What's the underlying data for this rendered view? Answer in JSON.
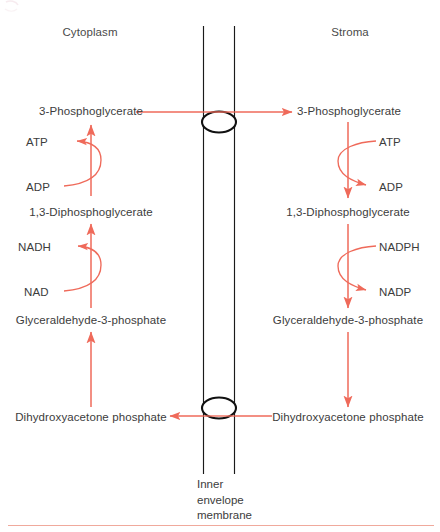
{
  "figure": {
    "accent_color": "#ef6a5a",
    "text_color": "#3c3c3c",
    "membrane_color": "#1a1a1a",
    "background_color": "#ffffff"
  },
  "regions": {
    "left": "Cytoplasm",
    "right": "Stroma"
  },
  "membrane": {
    "caption_line1": "Inner",
    "caption_line2": "envelope",
    "caption_line3": "membrane",
    "translocator_upper": "translocator-pore-upper",
    "translocator_lower": "translocator-pore-lower"
  },
  "cytoplasm": {
    "metabolites": [
      "3-Phosphoglycerate",
      "1,3-Diphosphoglycerate",
      "Glyceraldehyde-3-phosphate",
      "Dihydroxyacetone phosphate"
    ],
    "cofactors": [
      "ATP",
      "ADP",
      "NADH",
      "NAD"
    ]
  },
  "stroma": {
    "metabolites": [
      "3-Phosphoglycerate",
      "1,3-Diphosphoglycerate",
      "Glyceraldehyde-3-phosphate",
      "Dihydroxyacetone phosphate"
    ],
    "cofactors": [
      "ATP",
      "ADP",
      "NADPH",
      "NADP"
    ]
  },
  "transport": {
    "top_label": "3-Phosphoglycerate transported cytoplasm to stroma",
    "bottom_label": "Dihydroxyacetone phosphate transported stroma to cytoplasm"
  }
}
